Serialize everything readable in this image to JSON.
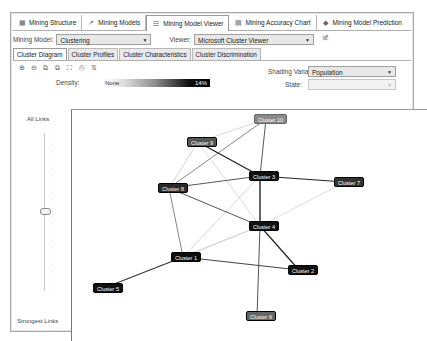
{
  "doc_tabs": [
    {
      "label": "Mining Structure",
      "icon": "structure-icon",
      "active": false
    },
    {
      "label": "Mining Models",
      "icon": "models-icon",
      "active": false
    },
    {
      "label": "Mining Model Viewer",
      "icon": "viewer-icon",
      "active": true
    },
    {
      "label": "Mining Accuracy Chart",
      "icon": "accuracy-chart-icon",
      "active": false
    },
    {
      "label": "Mining Model Prediction",
      "icon": "prediction-icon",
      "active": false
    }
  ],
  "model_row": {
    "model_label": "Mining Model:",
    "model_value": "Clustering",
    "viewer_label": "Viewer:",
    "viewer_value": "Microsoft Cluster Viewer"
  },
  "inner_tabs": [
    {
      "label": "Cluster Diagram",
      "active": true
    },
    {
      "label": "Cluster Profiles",
      "active": false
    },
    {
      "label": "Cluster Characteristics",
      "active": false
    },
    {
      "label": "Cluster Discrimination",
      "active": false
    }
  ],
  "toolbar": [
    "zoom-in-icon",
    "zoom-out-icon",
    "copy-graph-icon",
    "copy-view-icon",
    "fit-icon",
    "print-icon",
    "layout-icon"
  ],
  "density": {
    "label": "Density:",
    "min": "None",
    "max": "14%"
  },
  "shading": {
    "label": "Shading Variable:",
    "value": "Population",
    "state_label": "State:",
    "state_value": ""
  },
  "slider": {
    "top_label": "All Links",
    "bottom_label": "Strongest Links"
  },
  "colors": {
    "node_dark": "#111111",
    "node_mid": "#3a3a3a",
    "node_light": "#777777"
  },
  "nodes": [
    {
      "id": "c10",
      "label": "Cluster 10",
      "x": 182,
      "y": 4,
      "w": 24,
      "fill": "#8a8a8a"
    },
    {
      "id": "c9",
      "label": "Cluster 9",
      "x": 115,
      "y": 27,
      "w": 22,
      "fill": "#555555"
    },
    {
      "id": "c3",
      "label": "Cluster 3",
      "x": 177,
      "y": 61,
      "w": 22,
      "fill": "#111111"
    },
    {
      "id": "c7",
      "label": "Cluster 7",
      "x": 262,
      "y": 67,
      "w": 22,
      "fill": "#333333"
    },
    {
      "id": "c8",
      "label": "Cluster 8",
      "x": 86,
      "y": 73,
      "w": 22,
      "fill": "#2a2a2a"
    },
    {
      "id": "c4",
      "label": "Cluster 4",
      "x": 177,
      "y": 111,
      "w": 22,
      "fill": "#111111"
    },
    {
      "id": "c1",
      "label": "Cluster 1",
      "x": 99,
      "y": 142,
      "w": 24,
      "fill": "#0c0c0c"
    },
    {
      "id": "c2",
      "label": "Cluster 2",
      "x": 216,
      "y": 155,
      "w": 22,
      "fill": "#111111"
    },
    {
      "id": "c5",
      "label": "Cluster 5",
      "x": 21,
      "y": 173,
      "w": 22,
      "fill": "#111111"
    },
    {
      "id": "c6",
      "label": "Cluster 6",
      "x": 174,
      "y": 201,
      "w": 22,
      "fill": "#666666"
    }
  ],
  "edges": [
    {
      "from": "c9",
      "to": "c10",
      "color": "#cfcfcf",
      "w": 0.8
    },
    {
      "from": "c8",
      "to": "c10",
      "color": "#777777",
      "w": 0.9
    },
    {
      "from": "c10",
      "to": "c3",
      "color": "#444444",
      "w": 0.9
    },
    {
      "from": "c9",
      "to": "c3",
      "color": "#222222",
      "w": 1.3
    },
    {
      "from": "c9",
      "to": "c8",
      "color": "#c8c8c8",
      "w": 0.8
    },
    {
      "from": "c9",
      "to": "c4",
      "color": "#d0d0d0",
      "w": 0.8
    },
    {
      "from": "c8",
      "to": "c3",
      "color": "#555555",
      "w": 1.0
    },
    {
      "from": "c3",
      "to": "c7",
      "color": "#222222",
      "w": 1.1
    },
    {
      "from": "c3",
      "to": "c4",
      "color": "#111111",
      "w": 1.3
    },
    {
      "from": "c3",
      "to": "c1",
      "color": "#cccccc",
      "w": 0.8
    },
    {
      "from": "c8",
      "to": "c4",
      "color": "#555555",
      "w": 1.0
    },
    {
      "from": "c8",
      "to": "c1",
      "color": "#777777",
      "w": 0.9
    },
    {
      "from": "c7",
      "to": "c4",
      "color": "#d4d4d4",
      "w": 0.8
    },
    {
      "from": "c4",
      "to": "c1",
      "color": "#bdbdbd",
      "w": 0.8
    },
    {
      "from": "c4",
      "to": "c1b",
      "color": "#d8d8d8",
      "w": 0.7
    },
    {
      "from": "c4",
      "to": "c2",
      "color": "#222222",
      "w": 1.2
    },
    {
      "from": "c4",
      "to": "c6",
      "color": "#555555",
      "w": 1.0
    },
    {
      "from": "c1",
      "to": "c2",
      "color": "#444444",
      "w": 1.0
    },
    {
      "from": "c1",
      "to": "c5",
      "color": "#333333",
      "w": 1.1
    }
  ]
}
